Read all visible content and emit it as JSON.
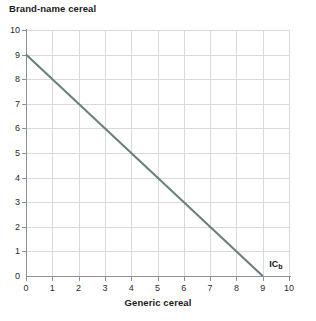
{
  "chart_data": {
    "type": "line",
    "title": "",
    "xlabel": "Generic cereal",
    "ylabel": "Brand-name cereal",
    "xlim": [
      0,
      10
    ],
    "ylim": [
      0,
      10
    ],
    "xticks": [
      "0",
      "1",
      "2",
      "3",
      "4",
      "5",
      "6",
      "7",
      "8",
      "9",
      "10"
    ],
    "yticks": [
      "0",
      "1",
      "2",
      "3",
      "4",
      "5",
      "6",
      "7",
      "8",
      "9",
      "10"
    ],
    "grid": true,
    "legend": "none",
    "series": [
      {
        "name": "ICb",
        "label": "IC",
        "label_subscript": "b",
        "color": "#6b8078",
        "x": [
          0,
          9
        ],
        "values": [
          9,
          0
        ],
        "annotation_at": {
          "x": 9.25,
          "y": 0.45
        }
      }
    ],
    "annotations": [
      {
        "text": "IC",
        "subscript": "b",
        "x": 9.25,
        "y": 0.45
      }
    ]
  },
  "colors": {
    "line": "#6b8078",
    "grid": "#d6dade",
    "axis": "#8b9095",
    "frame": "#c8cdd0",
    "text": "#1a1a1a",
    "background": "#ffffff"
  }
}
